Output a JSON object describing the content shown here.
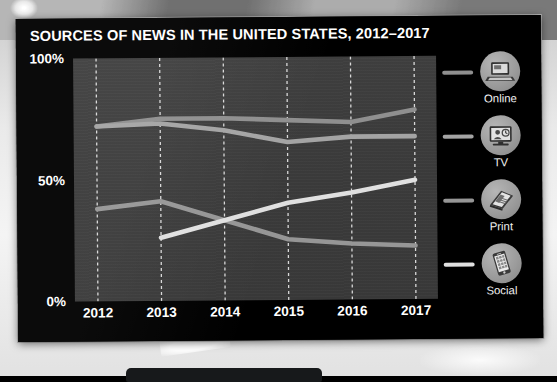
{
  "chart_data": {
    "type": "line",
    "title": "SOURCES OF NEWS IN THE UNITED STATES, 2012–2017",
    "xlabel": "",
    "ylabel": "",
    "x": [
      "2012",
      "2013",
      "2014",
      "2015",
      "2016",
      "2017"
    ],
    "categories": [
      "2012",
      "2013",
      "2014",
      "2015",
      "2016",
      "2017"
    ],
    "ylim": [
      0,
      100
    ],
    "ytick_labels": [
      "0%",
      "50%",
      "100%"
    ],
    "ytick_values": [
      0,
      50,
      100
    ],
    "grid": "vertical-dashed",
    "legend_position": "right",
    "series": [
      {
        "name": "Online",
        "color": "#8f8f8f",
        "icon": "laptop-icon",
        "values": [
          72,
          75,
          75,
          74,
          73,
          78
        ],
        "x_start_index": 0
      },
      {
        "name": "TV",
        "color": "#a4a4a4",
        "icon": "television-icon",
        "values": [
          72,
          73,
          70,
          65,
          67,
          67
        ],
        "x_start_index": 0
      },
      {
        "name": "Print",
        "color": "#969696",
        "icon": "newspaper-icon",
        "values": [
          38,
          41,
          33,
          25,
          23,
          22
        ],
        "x_start_index": 0
      },
      {
        "name": "Social",
        "color": "#e0e0e0",
        "icon": "smartphone-icon",
        "values": [
          null,
          26,
          33,
          40,
          44,
          49
        ],
        "x_start_index": 1
      }
    ]
  },
  "chart": {
    "title": "SOURCES OF NEWS IN THE UNITED STATES, 2012–2017",
    "y_axis": {
      "ticks": [
        {
          "label": "100%",
          "value": 100
        },
        {
          "label": "50%",
          "value": 50
        },
        {
          "label": "0%",
          "value": 0
        }
      ]
    },
    "x_axis": {
      "ticks": [
        {
          "label": "2012"
        },
        {
          "label": "2013"
        },
        {
          "label": "2014"
        },
        {
          "label": "2015"
        },
        {
          "label": "2016"
        },
        {
          "label": "2017"
        }
      ]
    }
  },
  "legend": {
    "items": [
      {
        "label": "Online",
        "icon": "laptop-icon",
        "color": "#8f8f8f"
      },
      {
        "label": "TV",
        "icon": "television-icon",
        "color": "#a4a4a4"
      },
      {
        "label": "Print",
        "icon": "newspaper-icon",
        "color": "#969696"
      },
      {
        "label": "Social",
        "icon": "smartphone-icon",
        "color": "#e0e0e0"
      }
    ]
  },
  "theme": {
    "screen_background": "#000000",
    "plot_background": "#3b3b3b",
    "text_color": "#ffffff",
    "gridline_color": "#d9d9d9"
  }
}
